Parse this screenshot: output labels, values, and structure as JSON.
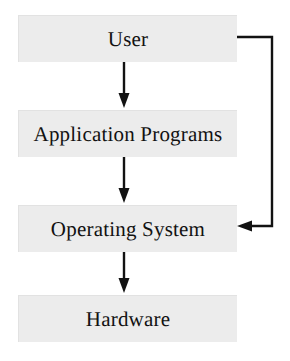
{
  "diagram": {
    "type": "flow-diagram",
    "orientation": "vertical",
    "background_color": "#ffffff",
    "node_fill_color": "#ececec",
    "node_shadow_color": "#8d8d8d",
    "connector_color": "#121212",
    "nodes": [
      {
        "id": "user",
        "label": "User"
      },
      {
        "id": "application",
        "label": "Application Programs"
      },
      {
        "id": "os",
        "label": "Operating System"
      },
      {
        "id": "hardware",
        "label": "Hardware"
      }
    ],
    "edges": [
      {
        "id": "user-to-application",
        "from": "User",
        "to": "Application Programs",
        "direction": "down"
      },
      {
        "id": "application-to-os",
        "from": "Application Programs",
        "to": "Operating System",
        "direction": "down"
      },
      {
        "id": "os-to-hardware",
        "from": "Operating System",
        "to": "Hardware",
        "direction": "down"
      },
      {
        "id": "user-to-os-feedback",
        "from": "User",
        "to": "Operating System",
        "direction": "right-down-left"
      }
    ]
  }
}
